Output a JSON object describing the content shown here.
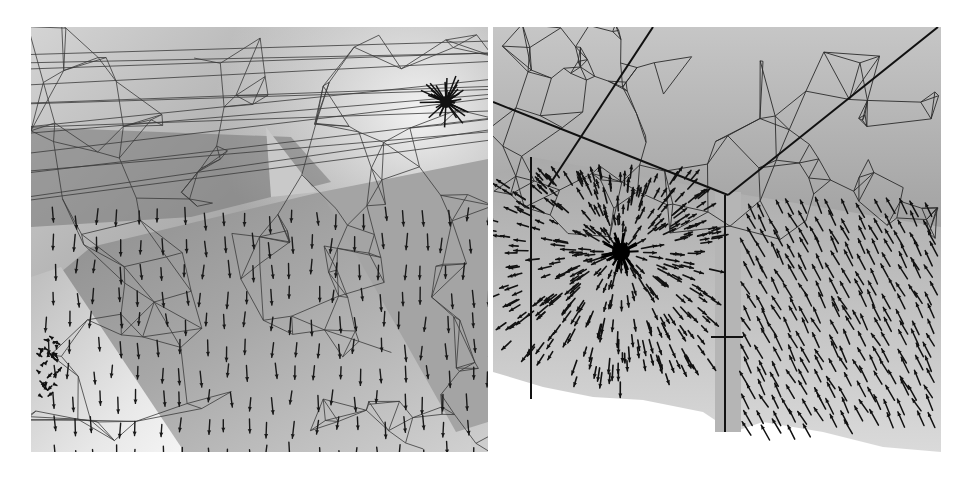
{
  "figure": {
    "width": 970,
    "height": 479,
    "background": "#ffffff",
    "panels": [
      {
        "id": "left",
        "description": "Triangulated mesh of room corner with ceiling, tilted planes and downward vector field; light-source singularity near upper right",
        "x": 31,
        "y": 27,
        "w": 457,
        "h": 425,
        "source": {
          "x": 415,
          "y": 75
        },
        "colors": {
          "light": "#e6e6e6",
          "mid": "#a9a9a9",
          "dark": "#6e6e6e",
          "line": "#3a3a3a",
          "arrow": "#1a1a1a"
        }
      },
      {
        "id": "right",
        "description": "Triangulated ceiling mesh above two wall planes with radial vector field around a dense singularity",
        "x": 493,
        "y": 27,
        "w": 448,
        "h": 425,
        "source": {
          "x": 128,
          "y": 225
        },
        "colors": {
          "light": "#d8d8d8",
          "mid": "#a7a7a7",
          "dark": "#8a8a8a",
          "line": "#2a2a2a",
          "arrow": "#111111"
        }
      }
    ]
  }
}
